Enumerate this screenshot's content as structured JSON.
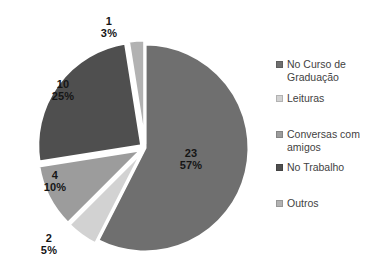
{
  "chart_data": {
    "type": "pie",
    "title": "",
    "legend_position": "right",
    "start_angle_deg": 0,
    "direction": "clockwise",
    "data_label_format": "value and percent",
    "total": 40,
    "slices": [
      {
        "label": "No Curso de Graduação",
        "value": 23,
        "percent": "57%",
        "color": "#6f6f6f"
      },
      {
        "label": "Leituras",
        "value": 2,
        "percent": "5%",
        "color": "#d2d2d2"
      },
      {
        "label": "Conversas com amigos",
        "value": 4,
        "percent": "10%",
        "color": "#9c9c9c"
      },
      {
        "label": "No Trabalho",
        "value": 10,
        "percent": "25%",
        "color": "#4f4f4f"
      },
      {
        "label": "Outros",
        "value": 1,
        "percent": "3%",
        "color": "#b2b2b2"
      }
    ]
  }
}
